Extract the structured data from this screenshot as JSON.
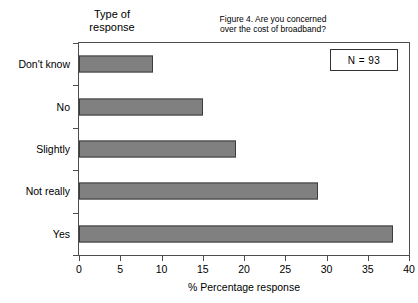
{
  "chart_data": {
    "type": "bar",
    "orientation": "horizontal",
    "title": "Figure 4.  Are you concerned\nover the cost of broadband?",
    "xlabel": "% Percentage response",
    "ylabel": "Type of\nresponse",
    "categories": [
      "Don't  know",
      "No",
      "Slightly",
      "Not really",
      "Yes"
    ],
    "values": [
      9,
      15,
      19,
      29,
      38
    ],
    "xlim": [
      0,
      40
    ],
    "xticks": [
      0,
      5,
      10,
      15,
      20,
      25,
      30,
      35,
      40
    ],
    "xtick_labels": [
      "0",
      "5",
      "10",
      "15",
      "20",
      "25",
      "30",
      "35",
      "40"
    ],
    "grid": false,
    "legend": null,
    "annotations": [
      {
        "name": "sample-size",
        "text": "N  =  93"
      }
    ],
    "series": [
      {
        "name": "% Percentage response",
        "values": [
          9,
          15,
          19,
          29,
          38
        ],
        "color": "#808080",
        "border_color": "#3d3d3d"
      }
    ]
  },
  "colors": {
    "bar_fill": "#808080",
    "bar_border": "#3d3d3d",
    "axis": "#4d4d4d",
    "background": "#ffffff",
    "text": "#000000"
  }
}
